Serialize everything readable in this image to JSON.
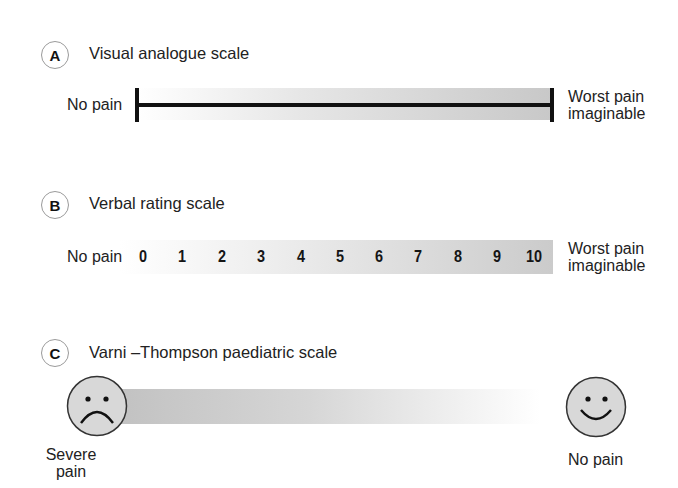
{
  "sections": [
    {
      "id": "A",
      "title": "Visual analogue scale",
      "left_label": "No pain",
      "right_label_line1": "Worst pain",
      "right_label_line2": "imaginable"
    },
    {
      "id": "B",
      "title": "Verbal rating scale",
      "left_label": "No pain",
      "right_label_line1": "Worst pain",
      "right_label_line2": "imaginable",
      "numbers": [
        "0",
        "1",
        "2",
        "3",
        "4",
        "5",
        "6",
        "7",
        "8",
        "9",
        "10"
      ]
    },
    {
      "id": "C",
      "title": "Varni –Thompson paediatric scale",
      "left_label_line1": "Severe",
      "left_label_line2": "pain",
      "right_label": "No pain",
      "left_icon": "sad-face-icon",
      "right_icon": "happy-face-icon"
    }
  ],
  "colors": {
    "bar_dark": "#c2c2c2",
    "bar_light": "#ffffff",
    "line": "#111111",
    "face_fill": "#d8d8d8"
  }
}
